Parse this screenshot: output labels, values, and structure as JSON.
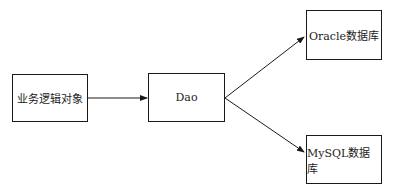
{
  "diagram": {
    "nodes": [
      {
        "id": "business",
        "label": "业务逻辑对象"
      },
      {
        "id": "dao",
        "label": "Dao"
      },
      {
        "id": "oracle",
        "label": "Oracle数据库"
      },
      {
        "id": "mysql",
        "label": "MySQL数据库"
      }
    ],
    "edges": [
      {
        "from": "business",
        "to": "dao"
      },
      {
        "from": "dao",
        "to": "oracle"
      },
      {
        "from": "dao",
        "to": "mysql"
      }
    ],
    "colors": {
      "stroke": "#1a1a1a",
      "background": "#ffffff"
    }
  }
}
